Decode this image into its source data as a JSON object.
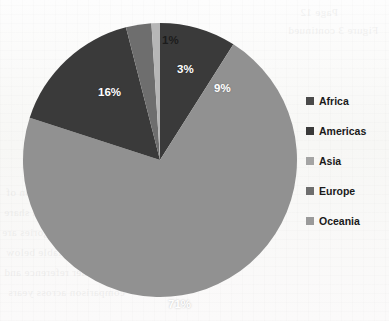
{
  "chart_data": {
    "type": "pie",
    "title": "",
    "categories": [
      "Africa",
      "Americas",
      "Asia",
      "Europe",
      "Oceania"
    ],
    "values": [
      9,
      16,
      71,
      3,
      1
    ],
    "value_unit": "%",
    "data_labels": [
      "9%",
      "16%",
      "71%",
      "3%",
      "1%"
    ],
    "colors": [
      "#3a3a3a",
      "#3a3a3a",
      "#919191",
      "#6e6e6e",
      "#b6b6b6"
    ],
    "legend_position": "right",
    "grid": false,
    "start_angle_deg": 0,
    "direction": "clockwise",
    "slices": [
      {
        "label": "Africa",
        "value": 9,
        "data_label": "9%",
        "color": "#3a3a3a",
        "label_color": "#ffffff",
        "label_x": 192,
        "label_y": 60,
        "label_inside": true
      },
      {
        "label": "Asia",
        "value": 71,
        "data_label": "71%",
        "color": "#919191",
        "label_color": "#ffffff",
        "label_x": 146,
        "label_y": 276,
        "label_inside": true
      },
      {
        "label": "Americas",
        "value": 16,
        "data_label": "16%",
        "color": "#3a3a3a",
        "label_color": "#ffffff",
        "label_x": 76,
        "label_y": 64,
        "label_inside": true
      },
      {
        "label": "Europe",
        "value": 3,
        "data_label": "3%",
        "color": "#6e6e6e",
        "label_color": "#ffffff",
        "label_x": 155,
        "label_y": 41,
        "label_inside": true
      },
      {
        "label": "Oceania",
        "value": 1,
        "data_label": "1%",
        "color": "#b6b6b6",
        "label_color": "#1c1c1c",
        "label_x": 140,
        "label_y": 12,
        "label_inside": false
      }
    ]
  },
  "legend": {
    "items": [
      {
        "label": "Africa",
        "color": "#4a4a4a"
      },
      {
        "label": "Americas",
        "color": "#3a3a3a"
      },
      {
        "label": "Asia",
        "color": "#a4a4a4"
      },
      {
        "label": "Europe",
        "color": "#6e6e6e"
      },
      {
        "label": "Oceania",
        "color": "#9a9a9a"
      }
    ]
  },
  "background": {
    "showthrough_lines": [
      {
        "text": "Page 12",
        "x": 300,
        "y": 6
      },
      {
        "text": "Figure 3 continued",
        "x": 288,
        "y": 24
      },
      {
        "text": "regional distribution of",
        "x": 6,
        "y": 186
      },
      {
        "text": "the total reported share",
        "x": 4,
        "y": 206
      },
      {
        "text": "remaining categories are",
        "x": 2,
        "y": 226
      },
      {
        "text": "shown in the table below",
        "x": 6,
        "y": 246
      },
      {
        "text": "for further reference and",
        "x": 4,
        "y": 266
      },
      {
        "text": "comparison across years",
        "x": 8,
        "y": 286
      }
    ]
  }
}
